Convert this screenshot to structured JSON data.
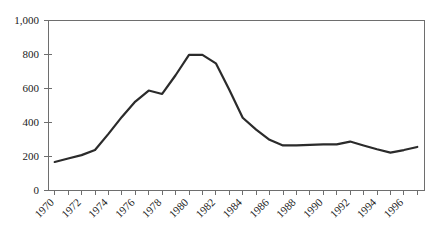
{
  "chart_data": {
    "type": "line",
    "title": "",
    "subtitle": "",
    "xlabel": "",
    "ylabel": "",
    "grid": false,
    "legend": "none",
    "xlim": [
      1969.5,
      1997.5
    ],
    "ylim": [
      0,
      1000
    ],
    "x": [
      1970,
      1971,
      1972,
      1973,
      1974,
      1975,
      1976,
      1977,
      1978,
      1979,
      1980,
      1981,
      1982,
      1983,
      1984,
      1985,
      1986,
      1987,
      1988,
      1989,
      1990,
      1991,
      1992,
      1993,
      1994,
      1995,
      1996,
      1997
    ],
    "values": [
      165,
      185,
      205,
      235,
      330,
      430,
      520,
      585,
      565,
      675,
      795,
      795,
      745,
      590,
      425,
      355,
      295,
      262,
      262,
      265,
      268,
      268,
      285,
      262,
      240,
      220,
      235,
      253
    ],
    "series": [
      {
        "name": "series-1",
        "values": [
          165,
          185,
          205,
          235,
          330,
          430,
          520,
          585,
          565,
          675,
          795,
          795,
          745,
          590,
          425,
          355,
          295,
          262,
          262,
          265,
          268,
          268,
          285,
          262,
          240,
          220,
          235,
          253
        ],
        "color": "#2b2b2b"
      }
    ],
    "ytick_values": [
      0,
      200,
      400,
      600,
      800,
      1000
    ],
    "ytick_labels": [
      "0",
      "200",
      "400",
      "600",
      "800",
      "1,000"
    ],
    "xtick_values": [
      1970,
      1972,
      1974,
      1976,
      1978,
      1980,
      1982,
      1984,
      1986,
      1988,
      1990,
      1992,
      1994,
      1996
    ],
    "xtick_labels": [
      "1970",
      "1972",
      "1974",
      "1976",
      "1978",
      "1980",
      "1982",
      "1984",
      "1986",
      "1988",
      "1990",
      "1992",
      "1994",
      "1996"
    ],
    "xtick_all_years": [
      1970,
      1971,
      1972,
      1973,
      1974,
      1975,
      1976,
      1977,
      1978,
      1979,
      1980,
      1981,
      1982,
      1983,
      1984,
      1985,
      1986,
      1987,
      1988,
      1989,
      1990,
      1991,
      1992,
      1993,
      1994,
      1995,
      1996,
      1997
    ],
    "line_color": "#2b2b2b",
    "frame_color": "#6e6e6e",
    "background_color": "#ffffff",
    "xtick_label_rotation": -45
  },
  "plot": {
    "left": 48,
    "right": 424,
    "top": 20,
    "bottom": 190
  }
}
